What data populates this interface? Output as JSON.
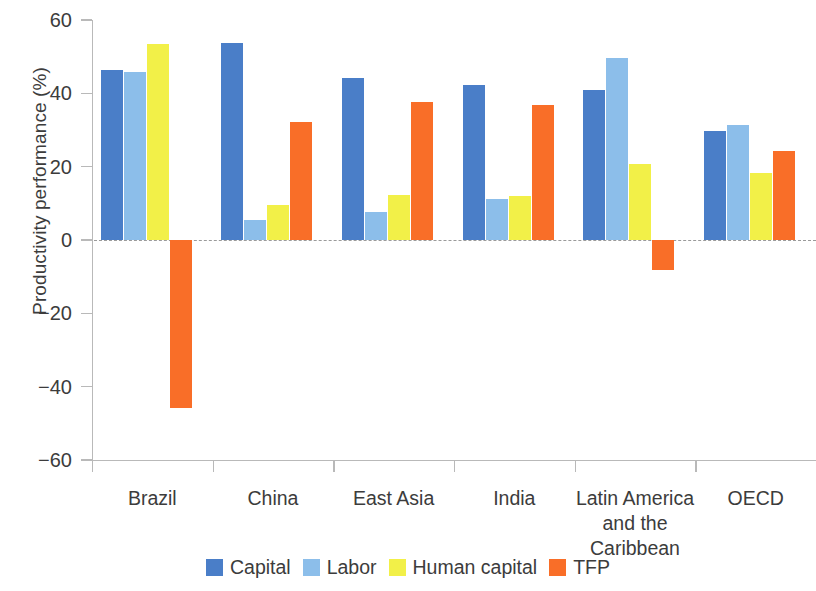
{
  "chart_data": {
    "type": "bar",
    "title": "",
    "xlabel": "",
    "ylabel": "Productivity performance (%)",
    "ylim": [
      -60,
      60
    ],
    "yticks": [
      60,
      40,
      20,
      0,
      -20,
      -40,
      -60
    ],
    "ytick_labels": [
      "60",
      "40",
      "20",
      "0",
      "−20",
      "−40",
      "−60"
    ],
    "grid": false,
    "zero_line": true,
    "legend_position": "bottom-center",
    "categories": [
      "Brazil",
      "China",
      "East Asia",
      "India",
      "Latin America and the Caribbean",
      "OECD"
    ],
    "category_label_lines": [
      [
        "Brazil"
      ],
      [
        "China"
      ],
      [
        "East Asia"
      ],
      [
        "India"
      ],
      [
        "Latin America",
        "and the",
        "Caribbean"
      ],
      [
        "OECD"
      ]
    ],
    "series": [
      {
        "name": "Capital",
        "color": "#4a7ec8",
        "values": [
          46.3,
          53.8,
          44.1,
          42.3,
          40.8,
          29.8
        ]
      },
      {
        "name": "Labor",
        "color": "#8cbeea",
        "values": [
          45.8,
          5.5,
          7.6,
          11.2,
          49.7,
          31.3
        ]
      },
      {
        "name": "Human capital",
        "color": "#f2f048",
        "values": [
          53.5,
          9.5,
          12.4,
          12.0,
          20.7,
          18.4
        ]
      },
      {
        "name": "TFP",
        "color": "#f96e28",
        "values": [
          -45.8,
          32.1,
          37.6,
          36.7,
          -8.2,
          24.2
        ]
      }
    ]
  },
  "axis": {
    "y_title": "Productivity performance (%)"
  },
  "legend": {
    "items": [
      {
        "label": "Capital",
        "color": "#4a7ec8",
        "icon": "square-swatch-icon"
      },
      {
        "label": "Labor",
        "color": "#8cbeea",
        "icon": "square-swatch-icon"
      },
      {
        "label": "Human capital",
        "color": "#f2f048",
        "icon": "square-swatch-icon"
      },
      {
        "label": "TFP",
        "color": "#f96e28",
        "icon": "square-swatch-icon"
      }
    ]
  }
}
